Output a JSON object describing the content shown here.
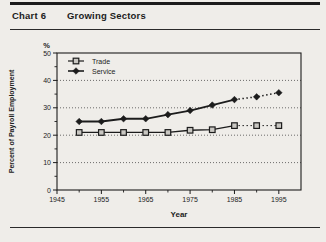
{
  "header": {
    "chart_label": "Chart 6",
    "chart_title": "Growing Sectors"
  },
  "chart_data": {
    "type": "line",
    "title": "Growing Sectors",
    "xlabel": "Year",
    "ylabel": "Percent of Payroll Employment",
    "y_unit_label": "%",
    "xlim": [
      1945,
      2000
    ],
    "ylim": [
      0,
      50
    ],
    "x_major_ticks": [
      1945,
      1955,
      1965,
      1975,
      1985,
      1995
    ],
    "x_minor_step": 5,
    "y_major_ticks": [
      0,
      10,
      20,
      30,
      40,
      50
    ],
    "y_minor_step": 5,
    "gridlines_y": [
      10,
      20,
      30,
      40
    ],
    "grid_style": "dotted",
    "legend_position": "top-left-inside",
    "x": [
      1950,
      1955,
      1960,
      1965,
      1970,
      1975,
      1980,
      1985,
      1990,
      1995
    ],
    "series": [
      {
        "name": "Trade",
        "marker": "open-square",
        "dashed_from_x": 1985,
        "values": [
          21,
          21,
          21,
          21,
          21,
          21.8,
          22,
          23.5,
          23.5,
          23.5
        ]
      },
      {
        "name": "Service",
        "marker": "filled-diamond",
        "dashed_from_x": 1985,
        "values": [
          25,
          25,
          26,
          26,
          27.5,
          29,
          31,
          33,
          34,
          35.5
        ]
      }
    ],
    "colors": {
      "ink": "#1c1c1c",
      "grid": "#4a4a4a",
      "square_fill": "#c9c7c2",
      "background": "#efede9"
    }
  }
}
